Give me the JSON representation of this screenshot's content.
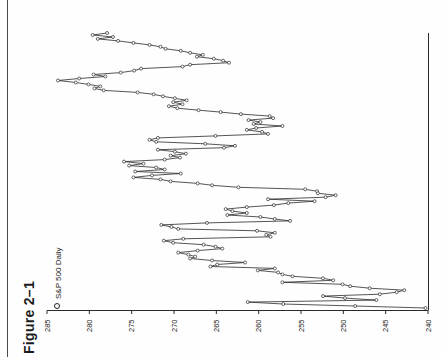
{
  "figure": {
    "label": "Figure 2–1",
    "orientation": "printed sideways; rotate 90° clockwise to view upright"
  },
  "legend": {
    "marker": "open-circle",
    "label": "S&P 500 Daily"
  },
  "chart_data": {
    "type": "line",
    "title": "Figure 2–1",
    "series_label": "S&P 500 Daily",
    "layout_note": "price axis horizontal at bottom of rotated page, 285 at left to 240 at right; time axis vertical, running top to bottom of the page; open-circle marker on every daily point",
    "price_axis_ticks": [
      285,
      280,
      275,
      270,
      265,
      260,
      255,
      250,
      245,
      240
    ],
    "price_axis_range": [
      240,
      285
    ],
    "grid": false,
    "n_points": 140,
    "values": [
      277.9,
      279.6,
      277.2,
      279.0,
      276.6,
      274.8,
      272.9,
      271.6,
      271.0,
      269.2,
      268.1,
      266.6,
      267.3,
      265.3,
      264.2,
      263.5,
      268.1,
      269.0,
      273.9,
      274.7,
      276.3,
      279.5,
      278.1,
      281.2,
      283.7,
      281.6,
      280.1,
      278.7,
      279.4,
      278.3,
      274.3,
      272.4,
      271.3,
      269.9,
      268.5,
      270.1,
      269.0,
      270.6,
      269.6,
      267.1,
      264.5,
      262.1,
      258.7,
      258.3,
      261.2,
      259.8,
      260.6,
      257.2,
      260.3,
      261.4,
      259.6,
      258.9,
      265.1,
      271.9,
      272.9,
      272.1,
      266.3,
      262.8,
      264.1,
      271.9,
      269.9,
      268.6,
      270.4,
      269.3,
      271.1,
      275.9,
      273.6,
      275.3,
      272.1,
      271.1,
      274.6,
      269.2,
      272.6,
      274.8,
      271.6,
      270.4,
      267.2,
      265.5,
      262.4,
      254.5,
      253.1,
      253.0,
      250.9,
      252.1,
      258.9,
      253.4,
      256.5,
      258.2,
      261.4,
      263.9,
      263.1,
      261.4,
      263.7,
      259.8,
      258.1,
      256.3,
      266.1,
      271.5,
      270.3,
      269.5,
      260.2,
      258.1,
      259.1,
      258.6,
      268.9,
      271.2,
      270.1,
      266.5,
      265.1,
      264.3,
      267.2,
      269.5,
      268.3,
      267.5,
      268.1,
      265.5,
      261.6,
      264.9,
      265.7,
      258.1,
      260.1,
      257.7,
      257.2,
      256.0,
      252.4,
      251.2,
      257.2,
      250.1,
      249.2,
      246.9,
      242.8,
      243.7,
      245.7,
      252.4,
      249.8,
      246.1,
      261.3,
      257.1,
      248.6,
      240.3
    ]
  },
  "style": {
    "ink_color": "#2a2a2a",
    "background": "#fefefe"
  }
}
